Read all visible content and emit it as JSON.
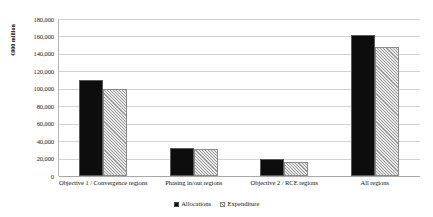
{
  "chart_data": {
    "type": "bar",
    "title": "",
    "xlabel": "",
    "ylabel": "€000 million",
    "ylim": [
      0,
      180000
    ],
    "ytick_step": 20000,
    "grid": true,
    "legend_position": "bottom-center",
    "categories": [
      "Objective 1 / Convergence regions",
      "Phasing in/out regions",
      "Objective 2 / RCE regions",
      "All regions"
    ],
    "ytick_labels": [
      "180,000",
      "160,000",
      "140,000",
      "120,000",
      "100,000",
      "80,000",
      "60,000",
      "40,000",
      "20,000",
      "0"
    ],
    "series": [
      {
        "name": "Allocations",
        "color": "#0d0d0d",
        "pattern": "solid",
        "values": [
          110000,
          32000,
          20000,
          162000
        ]
      },
      {
        "name": "Expenditure",
        "color": "#c9c9c9",
        "pattern": "diagonal-hatch",
        "values": [
          100000,
          31000,
          16000,
          148000
        ]
      }
    ]
  },
  "legend": {
    "items": [
      {
        "label": "Allocations",
        "swatch": "allocations"
      },
      {
        "label": "Expenditure",
        "swatch": "expenditure"
      }
    ]
  }
}
